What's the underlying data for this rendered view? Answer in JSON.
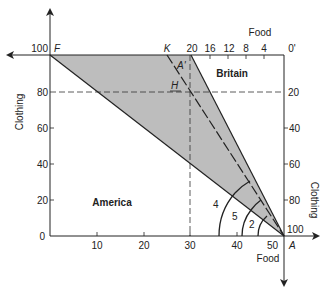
{
  "diagram": {
    "type": "box-diagram-trade",
    "regions": {
      "america": "America",
      "britain": "Britain"
    },
    "axes": {
      "america_x_label": "Food",
      "america_y_label": "Clothing",
      "britain_x_label": "Food",
      "britain_y_label": "Clothing",
      "america_x_ticks": [
        "10",
        "20",
        "30",
        "40",
        "50"
      ],
      "america_y_ticks": [
        "0",
        "20",
        "40",
        "60",
        "80",
        "100"
      ],
      "britain_x_ticks": [
        "20",
        "16",
        "12",
        "8",
        "4",
        "0'"
      ],
      "britain_y_ticks": [
        "20",
        "40",
        "60",
        "80",
        "100"
      ]
    },
    "points": {
      "F": "F",
      "K": "K",
      "A_prime": "A'",
      "H": "H",
      "A": "A"
    },
    "angle_labels": {
      "four": "4",
      "five": "5",
      "two": "2"
    },
    "colors": {
      "shade": "#b8b8b8",
      "line": "#222222",
      "background": "#ffffff"
    }
  }
}
